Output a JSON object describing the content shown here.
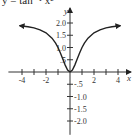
{
  "chart_data": {
    "type": "line",
    "title": "y = tan⁻¹ x²",
    "xlabel": "x",
    "ylabel": "y",
    "xlim": [
      -4.8,
      4.8
    ],
    "ylim": [
      -2.4,
      2.3
    ],
    "x_ticks": [
      -4,
      -3,
      -2,
      -1,
      1,
      2,
      3,
      4
    ],
    "x_tick_labels": [
      {
        "value": -4,
        "label": "-4"
      },
      {
        "value": -2,
        "label": "-2"
      },
      {
        "value": 2,
        "label": "2"
      },
      {
        "value": 4,
        "label": "4"
      }
    ],
    "y_ticks": [
      2.0,
      1.5,
      1.0,
      0.5,
      -0.5,
      -1.0,
      -1.5,
      -2.0
    ],
    "y_tick_labels": [
      {
        "value": 2.0,
        "label": "2.0"
      },
      {
        "value": 1.5,
        "label": "1.5"
      },
      {
        "value": 1.0,
        "label": "1.0"
      },
      {
        "value": 0.5,
        "label": ".5"
      },
      {
        "value": -0.5,
        "label": "-.5"
      },
      {
        "value": -1.0,
        "label": "-1.0"
      },
      {
        "value": -1.5,
        "label": "-1.5"
      },
      {
        "value": -2.0,
        "label": "-2.0"
      }
    ],
    "grid": false,
    "series": [
      {
        "name": "curve",
        "color": "#222222",
        "x": [
          -4.2,
          -3.5,
          -3,
          -2.5,
          -2,
          -1.5,
          -1.2,
          -1,
          -0.8,
          -0.6,
          -0.4,
          -0.2,
          0,
          0.2,
          0.4,
          0.6,
          0.8,
          1,
          1.2,
          1.5,
          2,
          2.5,
          3,
          3.5,
          4.2
        ],
        "y": [
          1.89,
          1.85,
          1.8,
          1.72,
          1.6,
          1.38,
          1.18,
          1.0,
          0.78,
          0.53,
          0.28,
          0.08,
          0,
          0.08,
          0.28,
          0.53,
          0.78,
          1.0,
          1.18,
          1.38,
          1.6,
          1.72,
          1.8,
          1.85,
          1.89
        ],
        "arrows": "both-ends"
      }
    ]
  }
}
